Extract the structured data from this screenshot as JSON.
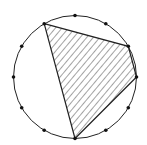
{
  "diagram": {
    "type": "circle-with-inscribed-polygon",
    "circle": {
      "cx": 75,
      "cy": 77,
      "r": 61.5
    },
    "point_count": 12,
    "points": [
      [
        75,
        15.5
      ],
      [
        105.8,
        23.7
      ],
      [
        128.3,
        46.3
      ],
      [
        136.5,
        77
      ],
      [
        128.3,
        107.8
      ],
      [
        105.8,
        130.3
      ],
      [
        75,
        138.5
      ],
      [
        44.2,
        130.3
      ],
      [
        21.7,
        107.8
      ],
      [
        13.5,
        77
      ],
      [
        21.7,
        46.3
      ],
      [
        44.2,
        23.7
      ]
    ],
    "shaded_polygon_vertex_indices": [
      11,
      2,
      3,
      6
    ],
    "colors": {
      "stroke": "#222222",
      "hatch": "#333333",
      "background": "#ffffff"
    }
  }
}
